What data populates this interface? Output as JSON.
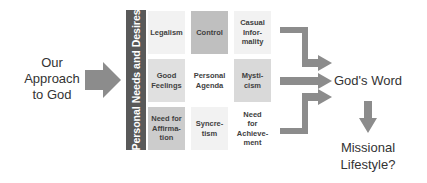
{
  "left_label": {
    "lines": [
      "Our",
      "Approach",
      "to God"
    ]
  },
  "vertical_bar": {
    "label": "Personal Needs and Desires"
  },
  "grid": {
    "cells": [
      {
        "lines": [
          "Legalism"
        ],
        "fill": "#f2f2f2"
      },
      {
        "lines": [
          "Control"
        ],
        "fill": "#bfbfbf"
      },
      {
        "lines": [
          "Casual",
          "Infor-",
          "mality"
        ],
        "fill": "#f2f2f2"
      },
      {
        "lines": [
          "Good",
          "Feelings"
        ],
        "fill": "#e0e0e0"
      },
      {
        "lines": [
          "Personal",
          "Agenda"
        ],
        "fill": "#ffffff"
      },
      {
        "lines": [
          "Mysti-",
          "cism"
        ],
        "fill": "#d9d9d9"
      },
      {
        "lines": [
          "Need for",
          "Affirma-",
          "tion"
        ],
        "fill": "#cccccc"
      },
      {
        "lines": [
          "Syncre-",
          "tism"
        ],
        "fill": "#f2f2f2"
      },
      {
        "lines": [
          "Need",
          "for",
          "Achieve-",
          "ment"
        ],
        "fill": "#ffffff"
      }
    ]
  },
  "target": {
    "label": "God's Word"
  },
  "outcome": {
    "lines": [
      "Missional",
      "Lifestyle?"
    ]
  },
  "colors": {
    "arrow": "#8c8c8c",
    "bar": "#595959",
    "text": "#333333"
  }
}
